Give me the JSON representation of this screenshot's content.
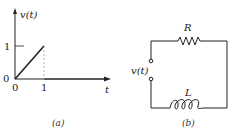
{
  "figure": {
    "panel_a": {
      "caption": "(a)",
      "y_axis_label": "v(t)",
      "x_axis_label": "t",
      "y_tick_label": "1",
      "origin_y_label": "0",
      "origin_x_label": "0",
      "x_tick_label": "1",
      "signal": "ramp from (0,0) to (1,1), then 0 for t > 1"
    },
    "panel_b": {
      "caption": "(b)",
      "source_label": "v(t)",
      "resistor_label": "R",
      "inductor_label": "L"
    },
    "colors": {
      "line": "#222222",
      "dashed": "#999999",
      "background": "#ffffff"
    }
  }
}
